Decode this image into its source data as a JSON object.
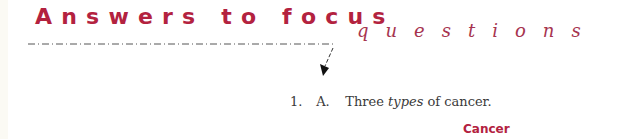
{
  "header": {
    "title_main": "Answers to focus",
    "title_sub": "questions"
  },
  "question": {
    "number": "1.",
    "letter": "A.",
    "text_before": "Three ",
    "text_emphasis": "types",
    "text_after": " of cancer."
  },
  "section": {
    "heading": "Cancer"
  },
  "colors": {
    "accent": "#b3223f",
    "subtitle": "#a6344f",
    "body_text": "#3a3a3a"
  }
}
